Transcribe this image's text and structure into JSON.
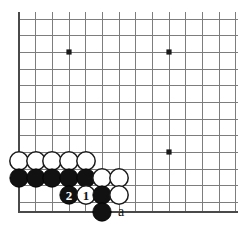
{
  "diagram": {
    "type": "go-board-diagram",
    "board": {
      "origin_x": 19,
      "origin_y": 19,
      "spacing": 16.67,
      "columns": 14,
      "rows": 12,
      "bottom_edge_y": 212,
      "left_edge_x": 19,
      "grid_color": "#7d7d7d",
      "edge_color": "#4a4a4a",
      "background_color": "#ffffff"
    },
    "star_points": [
      {
        "name": "star-point-left-top",
        "cx": 69,
        "cy": 52,
        "r": 2.6
      },
      {
        "name": "star-point-right-top",
        "cx": 169,
        "cy": 52,
        "r": 2.6
      },
      {
        "name": "star-point-right-bottom",
        "cx": 169,
        "cy": 152,
        "r": 2.6
      }
    ],
    "stone_radius": 9.2,
    "stones": [
      {
        "name": "white-stone-a1",
        "color": "white",
        "cx": 19,
        "cy": 161,
        "label": ""
      },
      {
        "name": "white-stone-b1",
        "color": "white",
        "cx": 36,
        "cy": 161,
        "label": ""
      },
      {
        "name": "white-stone-c1",
        "color": "white",
        "cx": 52,
        "cy": 161,
        "label": ""
      },
      {
        "name": "white-stone-d1",
        "color": "white",
        "cx": 69,
        "cy": 161,
        "label": ""
      },
      {
        "name": "white-stone-e1",
        "color": "white",
        "cx": 86,
        "cy": 161,
        "label": ""
      },
      {
        "name": "black-stone-a2",
        "color": "black",
        "cx": 19,
        "cy": 178,
        "label": ""
      },
      {
        "name": "black-stone-b2",
        "color": "black",
        "cx": 36,
        "cy": 178,
        "label": ""
      },
      {
        "name": "black-stone-c2",
        "color": "black",
        "cx": 52,
        "cy": 178,
        "label": ""
      },
      {
        "name": "black-stone-d2",
        "color": "black",
        "cx": 69,
        "cy": 178,
        "label": ""
      },
      {
        "name": "black-stone-e2",
        "color": "black",
        "cx": 86,
        "cy": 178,
        "label": ""
      },
      {
        "name": "white-stone-f2",
        "color": "white",
        "cx": 102,
        "cy": 178,
        "label": ""
      },
      {
        "name": "white-stone-g2",
        "color": "white",
        "cx": 119,
        "cy": 178,
        "label": ""
      },
      {
        "name": "black-stone-move-2",
        "color": "black",
        "cx": 69,
        "cy": 195,
        "label": "2"
      },
      {
        "name": "white-stone-move-1",
        "color": "white",
        "cx": 86,
        "cy": 195,
        "label": "1"
      },
      {
        "name": "black-stone-f3",
        "color": "black",
        "cx": 102,
        "cy": 195,
        "label": ""
      },
      {
        "name": "white-stone-g3",
        "color": "white",
        "cx": 119,
        "cy": 195,
        "label": ""
      },
      {
        "name": "black-stone-f4",
        "color": "black",
        "cx": 102,
        "cy": 212,
        "label": ""
      }
    ],
    "annotations": [
      {
        "name": "point-label-a",
        "text": "a",
        "x": 121,
        "y": 211
      }
    ]
  }
}
